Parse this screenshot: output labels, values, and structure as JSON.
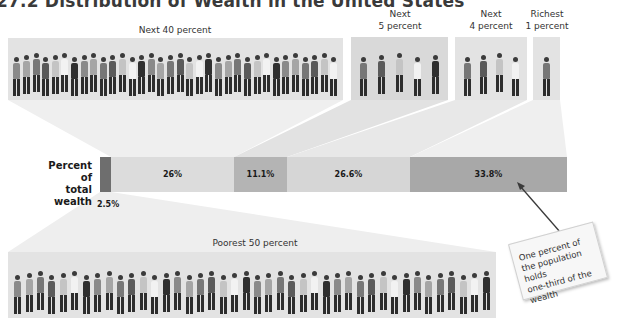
{
  "figure": {
    "title": "27.2 Distribution of Wealth in the United States"
  },
  "groups": {
    "next40": {
      "label": "Next 40 percent"
    },
    "next5": {
      "label_line1": "Next",
      "label_line2": "5 percent"
    },
    "next4": {
      "label_line1": "Next",
      "label_line2": "4 percent"
    },
    "richest1": {
      "label_line1": "Richest",
      "label_line2": "1 percent"
    },
    "poorest50": {
      "label": "Poorest 50 percent"
    }
  },
  "bar": {
    "label_line1": "Percent of",
    "label_line2": "total wealth",
    "segments": [
      {
        "group": "Poorest 50 percent",
        "value_label": "2.5%",
        "color": "#6e6e6e"
      },
      {
        "group": "Next 40 percent",
        "value_label": "26%",
        "color": "#dcdcdc"
      },
      {
        "group": "Next 5 percent",
        "value_label": "11.1%",
        "color": "#b4b4b4"
      },
      {
        "group": "Next 4 percent",
        "value_label": "26.6%",
        "color": "#d6d6d6"
      },
      {
        "group": "Richest 1 percent",
        "value_label": "33.8%",
        "color": "#a8a8a8"
      }
    ]
  },
  "annotation": {
    "line1": "One percent of",
    "line2": "the population holds",
    "line3": "one-third of the",
    "line4": "wealth"
  },
  "chart_data": {
    "type": "bar",
    "orientation": "horizontal-stacked",
    "title": "Distribution of Wealth in the United States",
    "ylabel": "Percent of total wealth",
    "categories": [
      "Poorest 50 percent",
      "Next 40 percent",
      "Next 5 percent",
      "Next 4 percent",
      "Richest 1 percent"
    ],
    "values": [
      2.5,
      26,
      11.1,
      26.6,
      33.8
    ],
    "value_labels": [
      "2.5%",
      "26%",
      "11.1%",
      "26.6%",
      "33.8%"
    ],
    "population_share_percent": [
      50,
      40,
      5,
      4,
      1
    ],
    "annotations": [
      "One percent of the population holds one-third of the wealth"
    ],
    "legend": null,
    "grid": false
  }
}
